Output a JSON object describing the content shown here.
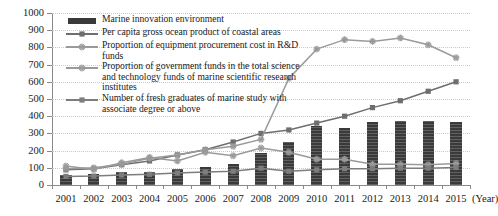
{
  "chart_data": {
    "type": "bar",
    "title": "",
    "xlabel": "(Year)",
    "ylabel": "",
    "categories": [
      "2001",
      "2002",
      "2003",
      "2004",
      "2005",
      "2006",
      "2007",
      "2008",
      "2009",
      "2010",
      "2011",
      "2012",
      "2013",
      "2014",
      "2015"
    ],
    "ylim": [
      0,
      1000
    ],
    "yticks": [
      0,
      100,
      200,
      300,
      400,
      500,
      600,
      700,
      800,
      900,
      1000
    ],
    "grid": true,
    "legend_position": "inside upper-left",
    "series": [
      {
        "name": "Marine innovation environment",
        "kind": "bar",
        "marker": "none",
        "color": "#3a3a3a",
        "values": [
          60,
          62,
          75,
          78,
          95,
          105,
          120,
          185,
          250,
          345,
          330,
          365,
          372,
          372,
          368
        ]
      },
      {
        "name": "Per capita gross ocean product of coastal areas",
        "kind": "line",
        "marker": "square",
        "color": "#6e6e6e",
        "values": [
          88,
          95,
          118,
          140,
          175,
          205,
          250,
          300,
          320,
          360,
          400,
          450,
          490,
          545,
          600
        ]
      },
      {
        "name": "Proportion of equipment procurement cost in R&D funds",
        "kind": "line",
        "marker": "star",
        "color": "#9a9a9a",
        "values": [
          110,
          90,
          130,
          160,
          140,
          190,
          170,
          215,
          190,
          150,
          150,
          120,
          120,
          118,
          125
        ]
      },
      {
        "name": "Proportion of government funds in the total science and technology funds of marine scientific research institutes",
        "kind": "line",
        "marker": "asterisk",
        "color": "#9a9a9a",
        "values": [
          95,
          100,
          120,
          155,
          175,
          205,
          225,
          265,
          620,
          790,
          845,
          835,
          855,
          815,
          740
        ]
      },
      {
        "name": "Number of fresh graduates of marine study with associate degree or above",
        "kind": "line",
        "marker": "square",
        "color": "#7d7d7d",
        "values": [
          50,
          52,
          58,
          62,
          70,
          75,
          80,
          98,
          80,
          88,
          95,
          95,
          98,
          98,
          102
        ]
      }
    ]
  }
}
